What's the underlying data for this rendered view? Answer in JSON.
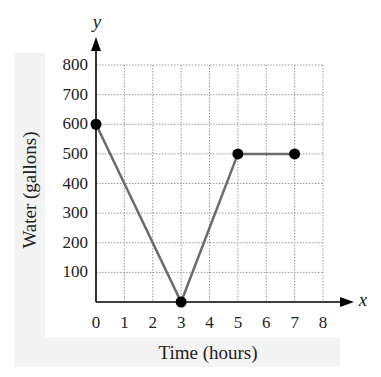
{
  "chart_data": {
    "type": "line",
    "title": "",
    "xlabel": "Time (hours)",
    "ylabel": "Water (gallons)",
    "x_axis_letter": "x",
    "y_axis_letter": "y",
    "xlim": [
      0,
      8
    ],
    "ylim": [
      0,
      800
    ],
    "grid": true,
    "x_ticks": [
      "0",
      "1",
      "2",
      "3",
      "4",
      "5",
      "6",
      "7",
      "8"
    ],
    "y_ticks": [
      "100",
      "200",
      "300",
      "400",
      "500",
      "600",
      "700",
      "800"
    ],
    "series": [
      {
        "name": "Water",
        "x": [
          0,
          3,
          5,
          7
        ],
        "y": [
          600,
          0,
          500,
          500
        ]
      }
    ],
    "colors": {
      "line": "#6b6b6b",
      "point": "#000000",
      "grid": "#9a9a9a",
      "axis": "#000000"
    }
  }
}
